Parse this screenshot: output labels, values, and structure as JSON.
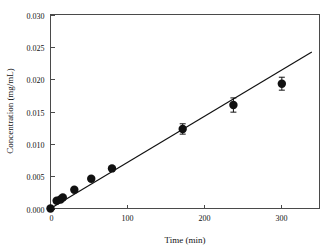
{
  "figure": {
    "background_color": "#ffffff",
    "axis_color": "#4a4a4a",
    "data_color": "#111111"
  },
  "chart_data": {
    "type": "scatter",
    "title": "",
    "subtitle": "",
    "xlabel": "Time (min)",
    "ylabel": "Concentration (mg/mL)",
    "xlim": [
      0,
      350
    ],
    "ylim": [
      0.0,
      0.03
    ],
    "xticks": [
      0,
      100,
      200,
      300
    ],
    "xtick_labels": [
      "0",
      "100",
      "200",
      "300"
    ],
    "yticks": [
      0.0,
      0.005,
      0.01,
      0.015,
      0.02,
      0.025,
      0.03
    ],
    "ytick_labels": [
      "0.000",
      "0.005",
      "0.010",
      "0.015",
      "0.020",
      "0.025",
      "0.030"
    ],
    "grid": false,
    "legend": null,
    "legend_position": "none",
    "marker_style": "filled-circle",
    "marker_size": 4.2,
    "error_bars": "vertical",
    "series": [
      {
        "name": "Concentration",
        "x": [
          0,
          8,
          13,
          16,
          31,
          53,
          80,
          172,
          238,
          301
        ],
        "y": [
          0.0,
          0.0012,
          0.0014,
          0.0017,
          0.0029,
          0.0046,
          0.0062,
          0.0123,
          0.016,
          0.0193
        ],
        "yerr": [
          0.0,
          0.0002,
          0.0002,
          0.0003,
          0.0002,
          0.0003,
          0.0003,
          0.0008,
          0.0011,
          0.001
        ]
      }
    ],
    "fit": {
      "type": "linear",
      "x": [
        0,
        340
      ],
      "y": [
        0.0,
        0.0242
      ],
      "slope": 7.12e-05,
      "intercept": 0.0
    },
    "annotations": []
  }
}
